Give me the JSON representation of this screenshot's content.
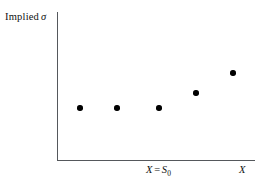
{
  "figure": {
    "width": 261,
    "height": 189,
    "background": "#ffffff"
  },
  "axes": {
    "line_color": "#55585c",
    "origin": {
      "x": 57,
      "y": 160
    },
    "y_axis_top": 12,
    "x_axis_right": 255,
    "y_label": {
      "prefix": "Implied",
      "symbol": "σ"
    },
    "x_label_strike": {
      "var": "X",
      "equals": "=",
      "base": "S",
      "subscript": "0"
    },
    "x_label_axis": "X"
  },
  "chart_data": {
    "type": "scatter",
    "title": "",
    "xlabel": "X",
    "ylabel": "Implied σ",
    "grid": false,
    "legend": null,
    "annotations": [
      {
        "text": "X = S₀0",
        "axis": "x",
        "position": "at-the-money strike"
      }
    ],
    "marker": {
      "shape": "circle",
      "color": "#000000",
      "size": 5.4
    },
    "x": [
      80,
      117,
      159,
      196,
      233
    ],
    "y": [
      108,
      108,
      108,
      93,
      73
    ],
    "points": [
      {
        "px": 80,
        "py": 108
      },
      {
        "px": 117,
        "py": 108
      },
      {
        "px": 159,
        "py": 108
      },
      {
        "px": 196,
        "py": 93
      },
      {
        "px": 233,
        "py": 73
      }
    ],
    "series": [
      {
        "name": "Implied volatility",
        "values": [
          1,
          1,
          1,
          1.4,
          1.9
        ]
      }
    ],
    "xlim": [
      57,
      255
    ],
    "ylim": [
      160,
      12
    ],
    "xticks": [],
    "yticks": []
  }
}
